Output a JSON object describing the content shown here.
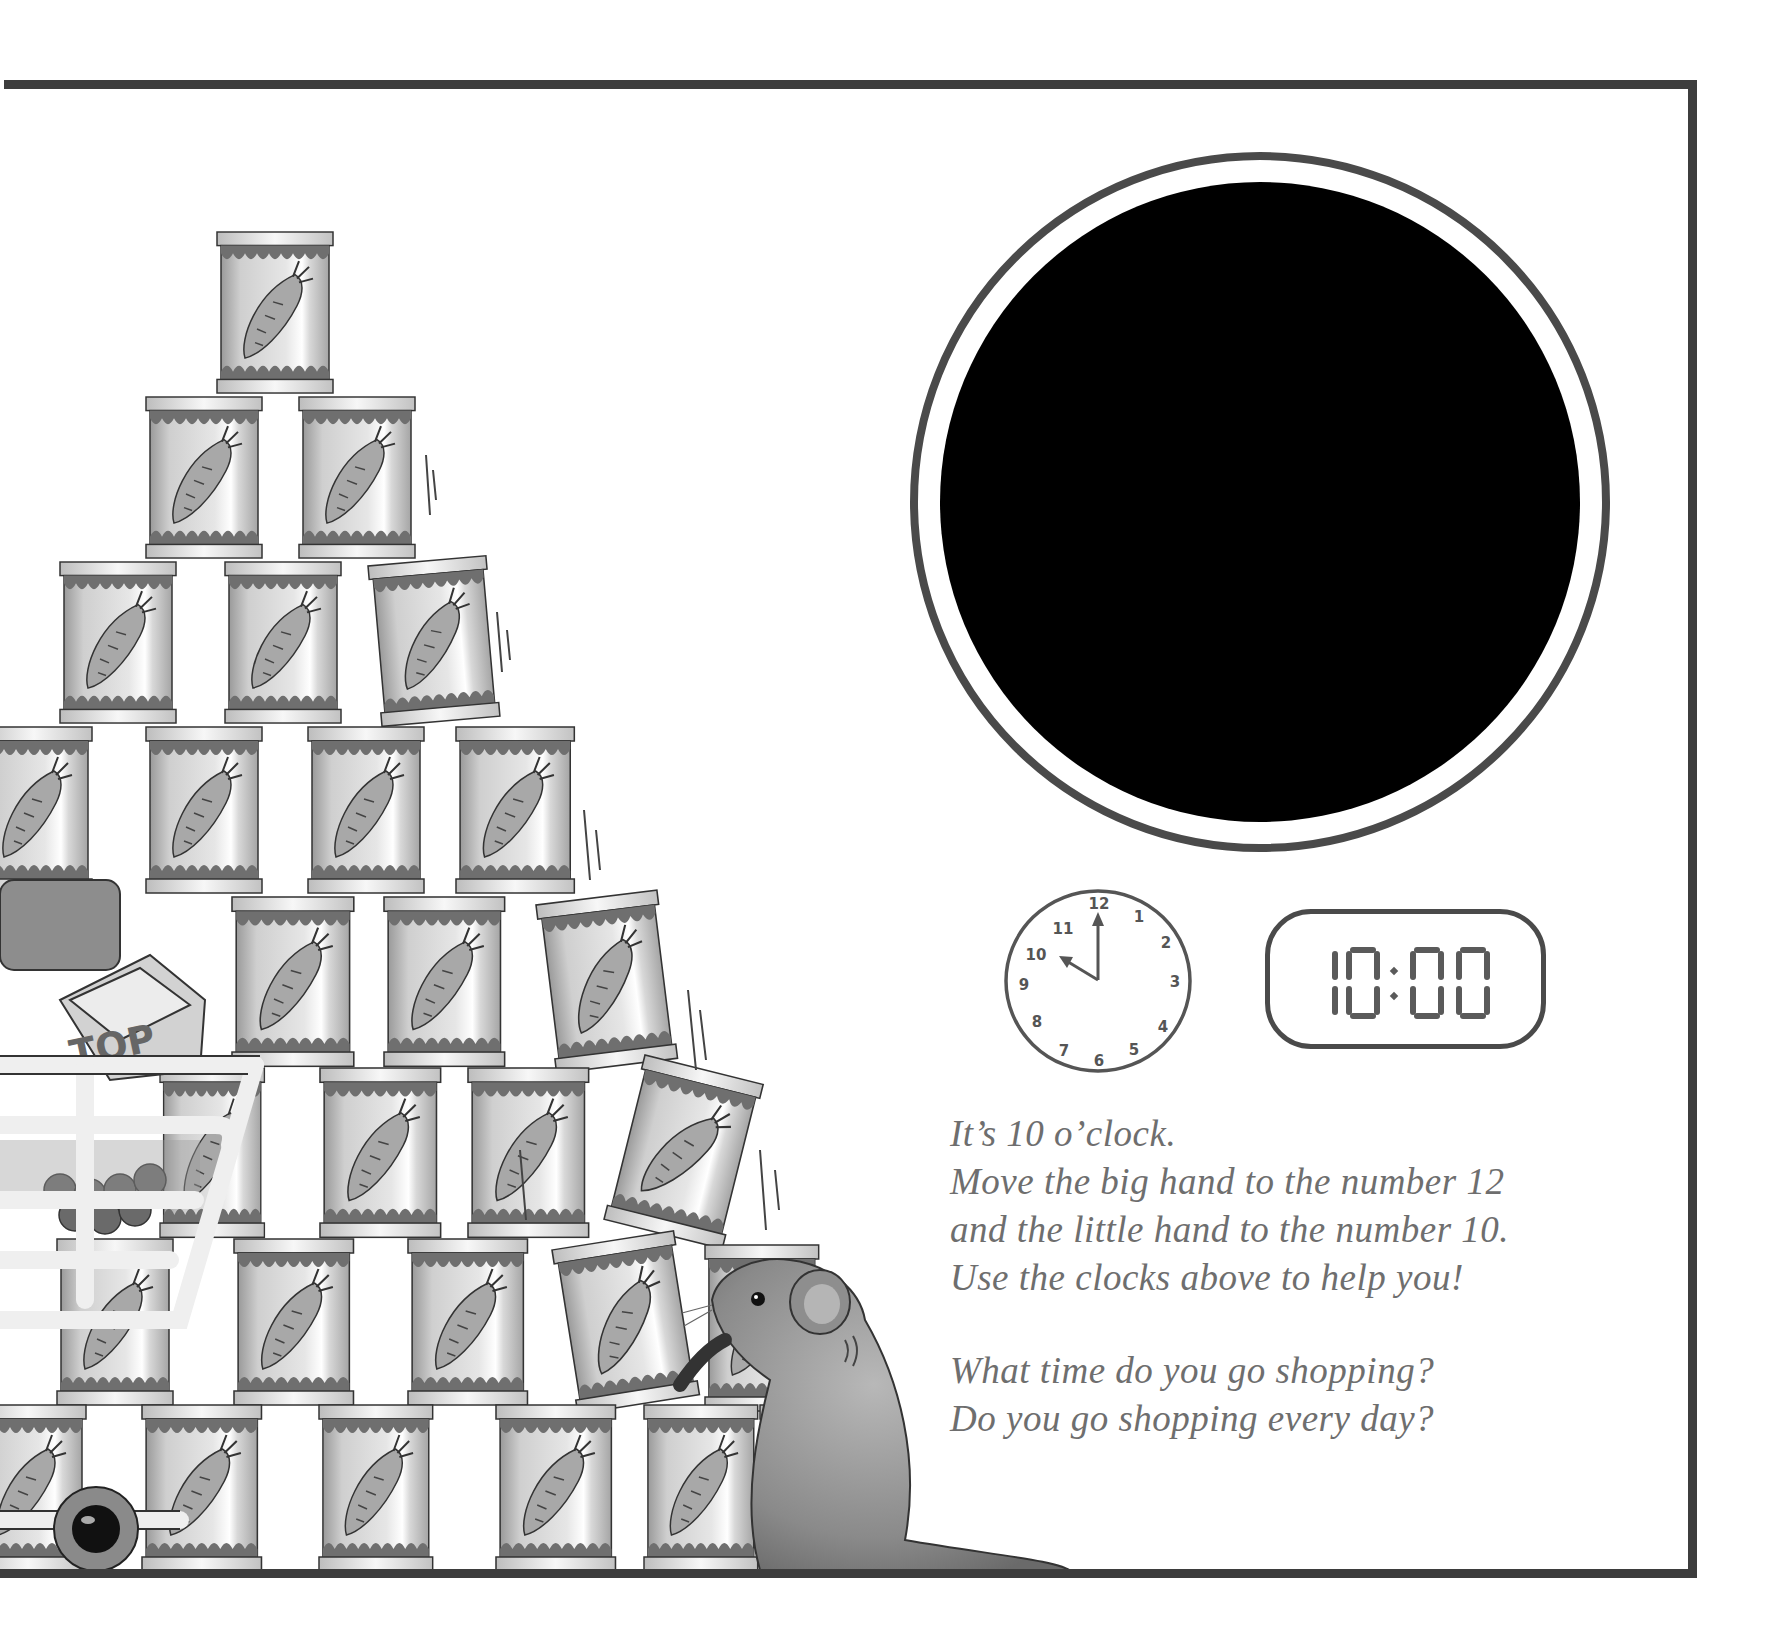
{
  "page": {
    "background": "#ffffff",
    "frame_color": "#3d3d3d"
  },
  "large_clock": {
    "description": "Large blank clock face (solid black disc inside a thin ring)",
    "ring_color": "#4a4a4a",
    "disc_color": "#000000"
  },
  "analog_clock": {
    "numbers": [
      "12",
      "1",
      "2",
      "3",
      "4",
      "5",
      "6",
      "7",
      "8",
      "9",
      "10",
      "11"
    ],
    "hour_hand_points_to": 10,
    "minute_hand_points_to": 12,
    "ink_color": "#555555"
  },
  "digital_clock": {
    "time": "10:00",
    "digits": [
      "1",
      "0",
      "0",
      "0"
    ],
    "segment_color": "#5a5a5a"
  },
  "instructions": {
    "lines": [
      "It’s 10 o’clock.",
      "Move the big hand to the number 12",
      "and the little hand to the number 10.",
      "Use the clocks above to help you!"
    ],
    "questions": [
      "What time do you go shopping?",
      "Do you go shopping every day?"
    ],
    "text_color": "#6e6e6e"
  },
  "illustration": {
    "subject": "Mouse pushing a tall pyramid of carrot cans next to a shopping cart",
    "can_label_icon": "carrot-icon",
    "carton_label": "TOP"
  }
}
